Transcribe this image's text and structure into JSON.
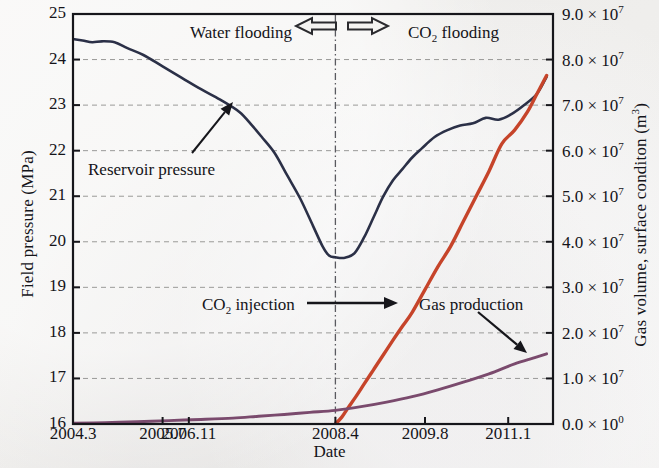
{
  "figure": {
    "background_color": "#f1f0ee",
    "frame_color": "#16161b"
  },
  "chart_data": {
    "type": "line",
    "title": "",
    "xlabel": "Date",
    "ylabel": "Field pressure (MPa)",
    "ylabel_right": "Gas volume, surface conditon (m³)",
    "grid": true,
    "legend_position": "inline-annotations",
    "xlim": [
      2004.3,
      2011.8
    ],
    "x_ticks": [
      "2004.3",
      "2005.7",
      "2006.11",
      "2008.4",
      "2009.8",
      "2011.1"
    ],
    "x_tick_values": [
      2004.3,
      2005.7,
      2006.11,
      2008.4,
      2009.8,
      2011.1
    ],
    "ylim_left": [
      16,
      25
    ],
    "y_ticks_left": [
      "16",
      "17",
      "18",
      "19",
      "20",
      "21",
      "22",
      "23",
      "24",
      "25"
    ],
    "ylim_right": [
      0,
      90000000
    ],
    "y_ticks_right": [
      {
        "mantissa": "0.0",
        "times": "×",
        "base": "10",
        "exp": "0"
      },
      {
        "mantissa": "1.0",
        "times": "×",
        "base": "10",
        "exp": "7"
      },
      {
        "mantissa": "2.0",
        "times": "×",
        "base": "10",
        "exp": "7"
      },
      {
        "mantissa": "3.0",
        "times": "×",
        "base": "10",
        "exp": "7"
      },
      {
        "mantissa": "4.0",
        "times": "×",
        "base": "10",
        "exp": "7"
      },
      {
        "mantissa": "5.0",
        "times": "×",
        "base": "10",
        "exp": "7"
      },
      {
        "mantissa": "6.0",
        "times": "×",
        "base": "10",
        "exp": "7"
      },
      {
        "mantissa": "7.0",
        "times": "×",
        "base": "10",
        "exp": "7"
      },
      {
        "mantissa": "8.0",
        "times": "×",
        "base": "10",
        "exp": "7"
      },
      {
        "mantissa": "9.0",
        "times": "×",
        "base": "10",
        "exp": "7"
      }
    ],
    "divider_x_value": 2008.4,
    "divider_style": "dash-dot vertical line",
    "series": [
      {
        "name": "Reservoir pressure",
        "axis": "left",
        "color": "#2b3047",
        "unit": "MPa",
        "x": [
          2004.3,
          2004.45,
          2004.6,
          2004.75,
          2004.95,
          2005.15,
          2005.4,
          2005.7,
          2006.0,
          2006.3,
          2006.6,
          2006.9,
          2007.1,
          2007.25,
          2007.45,
          2007.65,
          2007.85,
          2008.05,
          2008.2,
          2008.3,
          2008.4,
          2008.55,
          2008.7,
          2008.85,
          2009.0,
          2009.15,
          2009.3,
          2009.45,
          2009.6,
          2009.75,
          2009.95,
          2010.15,
          2010.35,
          2010.55,
          2010.75,
          2010.95,
          2011.15,
          2011.35,
          2011.55,
          2011.7
        ],
        "y": [
          24.45,
          24.42,
          24.38,
          24.4,
          24.38,
          24.25,
          24.1,
          23.85,
          23.6,
          23.35,
          23.12,
          22.85,
          22.55,
          22.3,
          21.95,
          21.45,
          20.95,
          20.35,
          19.9,
          19.7,
          19.66,
          19.65,
          19.75,
          20.1,
          20.55,
          21.0,
          21.35,
          21.6,
          21.85,
          22.05,
          22.3,
          22.45,
          22.55,
          22.6,
          22.72,
          22.68,
          22.8,
          23.0,
          23.25,
          23.62
        ]
      },
      {
        "name": "CO2 injection",
        "axis": "right",
        "color": "#c6442a",
        "unit": "m3",
        "x": [
          2008.4,
          2008.5,
          2008.6,
          2008.72,
          2008.85,
          2009.0,
          2009.15,
          2009.3,
          2009.45,
          2009.6,
          2009.8,
          2010.0,
          2010.2,
          2010.4,
          2010.6,
          2010.8,
          2011.0,
          2011.2,
          2011.4,
          2011.55,
          2011.7
        ],
        "y": [
          0,
          1500000,
          3600000,
          6000000,
          8800000,
          12000000,
          15200000,
          18400000,
          21500000,
          24500000,
          29500000,
          34500000,
          39000000,
          44500000,
          50000000,
          55500000,
          61500000,
          64500000,
          68500000,
          72500000,
          76500000
        ]
      },
      {
        "name": "Gas production",
        "axis": "right",
        "color": "#7a4a6d",
        "unit": "m3",
        "x": [
          2004.3,
          2004.8,
          2005.3,
          2005.8,
          2006.3,
          2006.8,
          2007.2,
          2007.6,
          2008.0,
          2008.4,
          2008.8,
          2009.2,
          2009.6,
          2010.0,
          2010.4,
          2010.8,
          2011.2,
          2011.5,
          2011.7
        ],
        "y": [
          150000,
          300000,
          500000,
          750000,
          1000000,
          1300000,
          1700000,
          2100000,
          2550000,
          3000000,
          3800000,
          4800000,
          6000000,
          7500000,
          9200000,
          11000000,
          13200000,
          14500000,
          15400000
        ]
      }
    ],
    "annotations": [
      {
        "id": "water-flooding",
        "text": "Water flooding",
        "x_px": 190,
        "y_px": 23
      },
      {
        "id": "co2-flooding",
        "text": "CO2 flooding",
        "display": "CO",
        "sub": "2",
        "rest": " flooding",
        "x_px": 408,
        "y_px": 23
      },
      {
        "id": "reservoir-pressure",
        "text": "Reservoir pressure",
        "x_px": 88,
        "y_px": 160
      },
      {
        "id": "co2-injection",
        "text": "CO2 injection",
        "display": "CO",
        "sub": "2",
        "rest": " injection",
        "x_px": 202,
        "y_px": 295
      },
      {
        "id": "gas-production",
        "text": "Gas production",
        "x_px": 419,
        "y_px": 295
      }
    ],
    "markers": [
      {
        "id": "arrow-left-hollow",
        "shape": "hollow-left-arrow",
        "x_px": 316,
        "y_px": 26
      },
      {
        "id": "arrow-right-hollow",
        "shape": "hollow-right-arrow",
        "x_px": 368,
        "y_px": 26
      }
    ]
  },
  "axes": {
    "left_title": "Field pressure (MPa)",
    "right_title_parts": {
      "lead": "Gas volume, surface conditon (m",
      "sup": "3",
      "tail": ")"
    },
    "x_title": "Date"
  },
  "labels": {
    "water_flooding": "Water flooding",
    "co2_prefix": "CO",
    "co2_sub": "2",
    "co2_flooding_rest": " flooding",
    "co2_injection_rest": " injection",
    "reservoir_pressure": "Reservoir pressure",
    "gas_production": "Gas production"
  }
}
